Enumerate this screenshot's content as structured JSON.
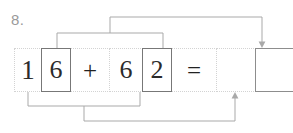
{
  "worksheet": {
    "question_number": "8.",
    "equation_text": "16 + 62 =",
    "cells": [
      {
        "id": "digit-1",
        "value": "1",
        "kind": "digit",
        "selected": false,
        "width": 28
      },
      {
        "id": "digit-6a",
        "value": "6",
        "kind": "digit",
        "selected": true,
        "width": 30
      },
      {
        "id": "operator-plus",
        "value": "+",
        "kind": "operator",
        "selected": false,
        "width": 40
      },
      {
        "id": "digit-6b",
        "value": "6",
        "kind": "digit",
        "selected": false,
        "width": 34
      },
      {
        "id": "digit-2",
        "value": "2",
        "kind": "digit",
        "selected": true,
        "width": 30
      },
      {
        "id": "operator-equals",
        "value": "=",
        "kind": "operator",
        "selected": false,
        "width": 46
      },
      {
        "id": "answer-box-1",
        "value": "",
        "kind": "answer",
        "selected": false,
        "width": 40
      },
      {
        "id": "answer-box-2",
        "value": "",
        "kind": "answer",
        "selected": true,
        "width": 40
      }
    ],
    "connectors": [
      {
        "id": "top-bracket",
        "description": "links tens digit 6 and ones digit 2 to the final answer box",
        "from": [
          "digit-6a",
          "digit-2"
        ],
        "to": "answer-box-2",
        "arrow": "down"
      },
      {
        "id": "bottom-bracket",
        "description": "links digit 1 and digit 6 to the first answer box",
        "from": [
          "digit-1",
          "digit-6b"
        ],
        "to": "answer-box-1",
        "arrow": "up"
      }
    ],
    "colors": {
      "cell_border_dotted": "#d3d3d3",
      "cell_border_selected": "#777777",
      "wire": "#a9a9a9",
      "text": "#2b2b2b",
      "question_number": "#9a9a9a",
      "background": "#ffffff"
    }
  }
}
